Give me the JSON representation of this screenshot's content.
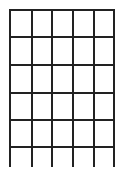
{
  "grid": {
    "description": "Hand-drawn grid, 5 columns x 6 rows, open bottom edge",
    "columns": 5,
    "rows": 6,
    "line_color": "#222222",
    "background": "#ffffff",
    "vertical_lines_x": [
      9,
      31,
      51,
      72,
      93,
      113
    ],
    "horizontal_lines_y": [
      9,
      36,
      64,
      92,
      119,
      146
    ],
    "vertical_top": 9,
    "vertical_bottom": 167
  }
}
